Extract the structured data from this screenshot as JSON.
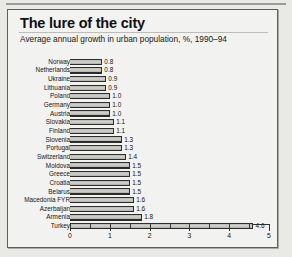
{
  "header": {
    "title": "The lure of the city",
    "subtitle": "Average annual growth in urban population, %, 1990–94"
  },
  "chart_data": {
    "type": "bar",
    "orientation": "horizontal",
    "title": "The lure of the city",
    "subtitle": "Average annual growth in urban population, %, 1990–94",
    "xlabel": "",
    "ylabel": "",
    "xlim": [
      0,
      5
    ],
    "xticks": [
      "0",
      "1",
      "2",
      "3",
      "4",
      "5"
    ],
    "xtick_values": [
      0,
      1,
      2,
      3,
      4,
      5
    ],
    "minor_tick_step": 0.5,
    "grid": false,
    "legend": false,
    "value_label_format": "one-decimal",
    "categories": [
      "Norway",
      "Netherlands",
      "Ukraine",
      "Lithuania",
      "Poland",
      "Germany",
      "Austria",
      "Slovakia",
      "Finland",
      "Slovenia",
      "Portugal",
      "Switzerland",
      "Moldova",
      "Greece",
      "Croatia",
      "Belarus",
      "Macedonia FYR",
      "Azerbaijan",
      "Armenia",
      "Turkey"
    ],
    "values": [
      0.8,
      0.8,
      0.9,
      0.9,
      1.0,
      1.0,
      1.0,
      1.1,
      1.1,
      1.3,
      1.3,
      1.4,
      1.5,
      1.5,
      1.5,
      1.5,
      1.6,
      1.6,
      1.8,
      4.6
    ],
    "value_labels": [
      "0.8",
      "0.8",
      "0.9",
      "0.9",
      "1.0",
      "1.0",
      "1.0",
      "1.1",
      "1.1",
      "1.3",
      "1.3",
      "1.4",
      "1.5",
      "1.5",
      "1.5",
      "1.5",
      "1.6",
      "1.6",
      "1.8",
      "4.6"
    ]
  },
  "colors": {
    "panel_background": "#f2f2f0",
    "page_background": "#e9e9e6",
    "bar_fill": "#cccbc7",
    "bar_edge": "#2b2b29",
    "text": "#161610",
    "axis": "#35352f"
  }
}
